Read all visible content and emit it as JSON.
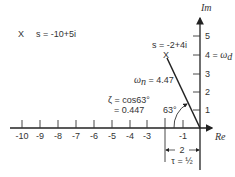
{
  "diagram": {
    "axes": {
      "real_label": "Re",
      "imag_label": "Im",
      "real_ticks": [
        "-10",
        "-9",
        "-8",
        "-7",
        "-6",
        "-5",
        "-4",
        "-3",
        "-2",
        "-1"
      ],
      "real_tick_labels_shown": [
        "-10",
        "-9",
        "-8",
        "-7",
        "-6",
        "-5",
        "-4",
        "-3",
        "-1"
      ],
      "imag_ticks": [
        "1",
        "2",
        "3",
        "4 = ω_d",
        "5"
      ]
    },
    "poles": [
      {
        "label": "s = -10+5i",
        "marker": "X",
        "re": -10,
        "im": 5
      },
      {
        "label": "s = -2+4i",
        "marker": "X",
        "re": -2,
        "im": 4
      }
    ],
    "annotations": {
      "omega_n": "ω_n = 4.47",
      "zeta_line1": "ζ = cos63°",
      "zeta_line2": "= 0.447",
      "angle": "63°",
      "omega_d_suffix": "= ω_d",
      "width_label": "2",
      "tau_label": "τ = ½"
    }
  }
}
